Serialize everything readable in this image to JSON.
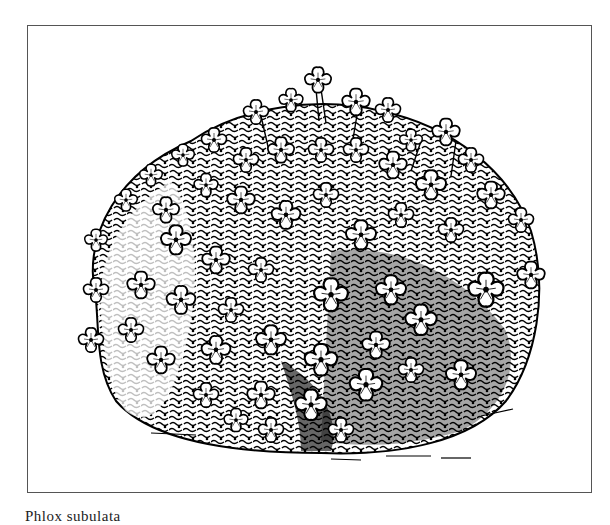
{
  "figure": {
    "style": "pen-and-ink line drawing",
    "frame_color": "#555555",
    "ink_color": "#000000",
    "paper_color": "#ffffff",
    "caption": "Phlox subulata"
  }
}
